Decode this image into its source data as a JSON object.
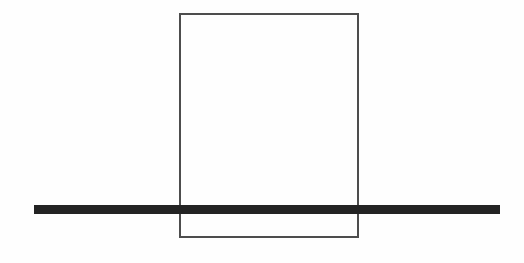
{
  "canvas": {
    "width": 524,
    "height": 263,
    "background_color": "#fefefe",
    "description": "Minimal black-and-white line drawing: a tall unfilled rectangle outline with a thick horizontal bar running across the full width near the bottom, overlapping the rectangle."
  },
  "shapes": {
    "rectangle": {
      "name": "rectangle-outline",
      "x": 180,
      "y": 14,
      "width": 178,
      "height": 223,
      "stroke_color": "#4d4d4d",
      "stroke_width": 1.6,
      "fill": "none"
    },
    "bar": {
      "name": "horizontal-bar",
      "x": 34,
      "y": 205,
      "width": 466,
      "height": 9,
      "fill_color": "#232323",
      "stroke": "none"
    }
  },
  "labels": {
    "text_present": "none"
  }
}
